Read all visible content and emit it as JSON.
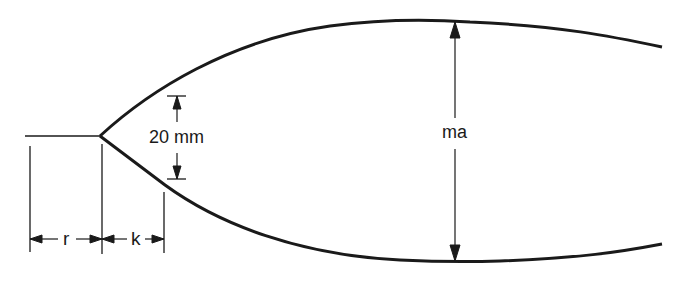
{
  "diagram": {
    "type": "dimensioned-profile-drawing",
    "stroke_color": "#1a1a1a",
    "background": "#ffffff",
    "labels": {
      "gap_dimension": "20 mm",
      "max_dimension": "ma",
      "left_span": "r",
      "right_span": "k"
    },
    "dimensions": [
      {
        "id": "r",
        "label": "r",
        "orientation": "horizontal",
        "from_x": 30,
        "to_x": 102,
        "y": 239
      },
      {
        "id": "k",
        "label": "k",
        "orientation": "horizontal",
        "from_x": 102,
        "to_x": 164,
        "y": 239
      },
      {
        "id": "gap",
        "label": "20 mm",
        "orientation": "vertical",
        "from_y": 96,
        "to_y": 179,
        "x": 177
      },
      {
        "id": "ma",
        "label": "ma",
        "orientation": "vertical",
        "from_y": 22,
        "to_y": 261,
        "x": 455
      }
    ]
  }
}
